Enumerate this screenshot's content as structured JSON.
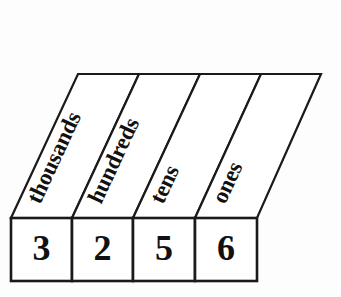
{
  "diagram": {
    "colors": {
      "background": "#fdfdfd",
      "cell_fill": "#ffffff",
      "stroke": "#1a1a1a",
      "text": "#111111"
    },
    "columns": [
      {
        "label": "thousands",
        "digit": "3"
      },
      {
        "label": "hundreds",
        "digit": "2"
      },
      {
        "label": "tens",
        "digit": "5"
      },
      {
        "label": "ones",
        "digit": "6"
      }
    ],
    "number": "3256"
  }
}
